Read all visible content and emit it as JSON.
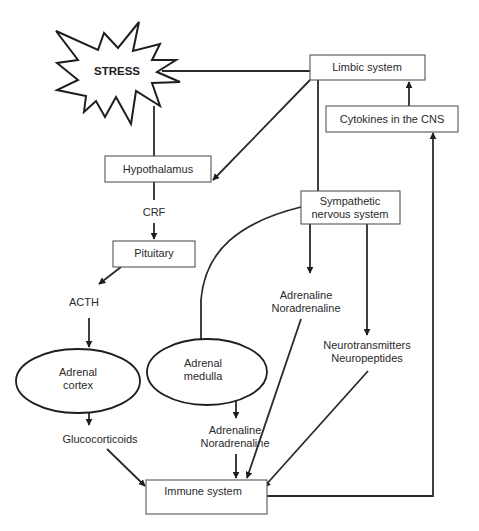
{
  "diagram": {
    "type": "stress-immune pathway flowchart",
    "nodes": {
      "stress": {
        "label": "STRESS",
        "shape": "starburst"
      },
      "limbic": {
        "label": "Limbic system",
        "shape": "box"
      },
      "cytokines": {
        "label": "Cytokines in the CNS",
        "shape": "box"
      },
      "hypothalamus": {
        "label": "Hypothalamus",
        "shape": "box"
      },
      "crf": {
        "label": "CRF",
        "shape": "text"
      },
      "pituitary": {
        "label": "Pituitary",
        "shape": "box"
      },
      "acth": {
        "label": "ACTH",
        "shape": "text"
      },
      "sympathetic": {
        "label_line1": "Sympathetic",
        "label_line2": "nervous system",
        "shape": "box"
      },
      "sns_adrenaline": {
        "label_line1": "Adrenaline",
        "label_line2": "Noradrenaline",
        "shape": "text"
      },
      "neuro": {
        "label_line1": "Neurotransmitters",
        "label_line2": "Neuropeptides",
        "shape": "text"
      },
      "adrenal_cortex": {
        "label_line1": "Adrenal",
        "label_line2": "cortex",
        "shape": "ellipse"
      },
      "adrenal_medulla": {
        "label_line1": "Adrenal",
        "label_line2": "medulla",
        "shape": "ellipse"
      },
      "glucocorticoids": {
        "label": "Glucocorticoids",
        "shape": "text"
      },
      "medulla_adrenaline": {
        "label_line1": "Adrenaline",
        "label_line2": "Noradrenaline",
        "shape": "text"
      },
      "immune": {
        "label": "Immune system",
        "shape": "box"
      }
    },
    "edges": [
      {
        "from": "stress",
        "to": "limbic",
        "arrow": false
      },
      {
        "from": "stress",
        "to": "hypothalamus",
        "arrow": false
      },
      {
        "from": "limbic",
        "to": "hypothalamus",
        "arrow": true
      },
      {
        "from": "limbic",
        "to": "sympathetic",
        "arrow": false
      },
      {
        "from": "cytokines",
        "to": "limbic",
        "arrow": true
      },
      {
        "from": "immune",
        "to": "cytokines",
        "arrow": true
      },
      {
        "from": "hypothalamus",
        "to": "crf",
        "arrow": false
      },
      {
        "from": "crf",
        "to": "pituitary",
        "arrow": true
      },
      {
        "from": "pituitary",
        "to": "acth",
        "arrow": true
      },
      {
        "from": "acth",
        "to": "adrenal_cortex",
        "arrow": true
      },
      {
        "from": "adrenal_cortex",
        "to": "glucocorticoids",
        "arrow": true
      },
      {
        "from": "glucocorticoids",
        "to": "immune",
        "arrow": true
      },
      {
        "from": "sympathetic",
        "to": "adrenal_medulla",
        "arrow": false
      },
      {
        "from": "sympathetic",
        "to": "sns_adrenaline",
        "arrow": true
      },
      {
        "from": "sympathetic",
        "to": "neuro",
        "arrow": true
      },
      {
        "from": "sns_adrenaline",
        "to": "immune",
        "arrow": true
      },
      {
        "from": "neuro",
        "to": "immune",
        "arrow": true
      },
      {
        "from": "adrenal_medulla",
        "to": "medulla_adrenaline",
        "arrow": true
      },
      {
        "from": "medulla_adrenaline",
        "to": "immune",
        "arrow": true
      }
    ]
  }
}
